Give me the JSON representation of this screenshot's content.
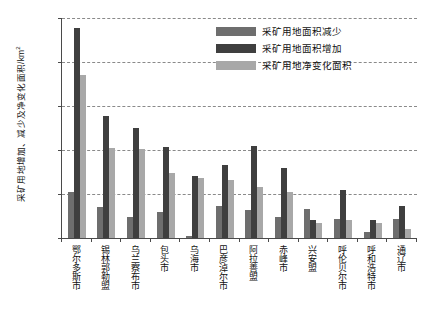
{
  "chart_data": {
    "type": "bar",
    "title": "",
    "xlabel": "",
    "ylabel": "采矿用地增加、减少及净变化面积/km²",
    "ylim": [
      0,
      500
    ],
    "yticks": [
      0,
      100,
      200,
      300,
      400,
      500
    ],
    "grid": true,
    "legend_position": "top-right",
    "categories": [
      "鄂尔多斯市",
      "锡林郭勒盟",
      "乌兰察布市",
      "包头市",
      "乌海市",
      "巴彦淖尔市",
      "阿拉善盟",
      "赤峰市",
      "兴安盟",
      "呼伦贝尔市",
      "呼和浩特市",
      "通辽市"
    ],
    "series": [
      {
        "name": "采矿用地面积减少",
        "color": "#6e6e6e",
        "values": [
          105,
          70,
          48,
          58,
          5,
          72,
          63,
          47,
          67,
          43,
          14,
          43
        ]
      },
      {
        "name": "采矿用地面积增加",
        "color": "#3f3f3f",
        "values": [
          477,
          278,
          250,
          206,
          140,
          166,
          208,
          158,
          42,
          109,
          42,
          72
        ]
      },
      {
        "name": "采矿用地净变化面积",
        "color": "#a8a8a8",
        "values": [
          370,
          204,
          202,
          147,
          136,
          131,
          115,
          104,
          33,
          42,
          33,
          20
        ]
      }
    ]
  },
  "axis": {
    "y_tick_labels": [
      "500",
      "400",
      "300",
      "200",
      "100",
      "0"
    ]
  }
}
